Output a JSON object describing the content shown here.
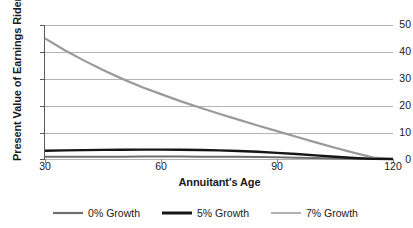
{
  "chart_data": {
    "type": "line",
    "title": "",
    "xlabel": "Annuitant's Age",
    "ylabel": "Present Value of Earnings Rider",
    "xlim": [
      30,
      120
    ],
    "ylim": [
      0,
      50
    ],
    "xticks": [
      30,
      60,
      90,
      120
    ],
    "yticks": [
      0,
      10,
      20,
      30,
      40,
      50
    ],
    "grid": "horizontal",
    "legend_position": "bottom",
    "x": [
      30,
      35,
      40,
      45,
      50,
      55,
      60,
      65,
      70,
      75,
      80,
      85,
      90,
      95,
      100,
      105,
      110,
      115,
      120
    ],
    "series": [
      {
        "name": "0% Growth",
        "color": "#6e6e6e",
        "width": 2.0,
        "values": [
          0.8,
          0.82,
          0.84,
          0.86,
          0.88,
          0.9,
          0.9,
          0.9,
          0.88,
          0.85,
          0.8,
          0.72,
          0.62,
          0.5,
          0.36,
          0.22,
          0.1,
          0.0,
          0.0
        ]
      },
      {
        "name": "5% Growth",
        "color": "#151515",
        "width": 2.4,
        "values": [
          3.1,
          3.2,
          3.3,
          3.4,
          3.45,
          3.5,
          3.5,
          3.45,
          3.35,
          3.2,
          3.0,
          2.7,
          2.3,
          1.85,
          1.35,
          0.85,
          0.4,
          0.05,
          0.0
        ]
      },
      {
        "name": "7% Growth",
        "color": "#9a9a9a",
        "width": 2.2,
        "values": [
          45.0,
          40.7,
          36.8,
          33.2,
          29.9,
          26.9,
          24.2,
          21.6,
          19.2,
          16.9,
          14.7,
          12.5,
          10.4,
          8.3,
          6.2,
          4.2,
          2.3,
          0.5,
          0.0
        ]
      }
    ]
  },
  "legend": {
    "items": [
      {
        "label": "0% Growth"
      },
      {
        "label": "5% Growth"
      },
      {
        "label": "7% Growth"
      }
    ]
  },
  "axes": {
    "y_tick_labels": [
      "50",
      "40",
      "30",
      "20",
      "10",
      "0"
    ],
    "x_tick_labels": [
      "30",
      "60",
      "90",
      "120"
    ]
  }
}
